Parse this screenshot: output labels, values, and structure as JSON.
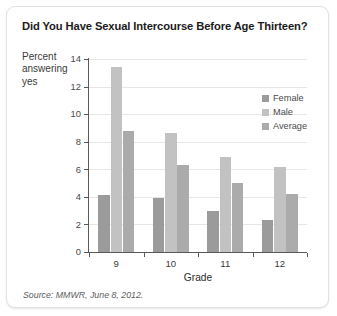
{
  "card": {
    "title": "Did You Have Sexual Intercourse Before Age Thirteen?",
    "source_note": "Source: MMWR, June 8, 2012."
  },
  "chart_data": {
    "type": "bar",
    "title": "Did You Have Sexual Intercourse Before Age Thirteen?",
    "xlabel": "Grade",
    "ylabel": "Percent answering yes",
    "categories": [
      "9",
      "10",
      "11",
      "12"
    ],
    "series": [
      {
        "name": "Female",
        "color": "#9b9b9b",
        "values": [
          4.1,
          3.9,
          3.0,
          2.3
        ]
      },
      {
        "name": "Male",
        "color": "#c2c2c2",
        "values": [
          13.4,
          8.6,
          6.9,
          6.2
        ]
      },
      {
        "name": "Average",
        "color": "#ababab",
        "values": [
          8.8,
          6.3,
          5.0,
          4.2
        ]
      }
    ],
    "ylim": [
      0,
      14
    ],
    "yticks": [
      0,
      2,
      4,
      6,
      8,
      10,
      12,
      14
    ],
    "ytick_labels": [
      "0",
      "2",
      "4",
      "6",
      "8",
      "10",
      "12",
      "14"
    ],
    "grid": true,
    "grid_axis": "y",
    "legend_position": "inside-top-right"
  }
}
